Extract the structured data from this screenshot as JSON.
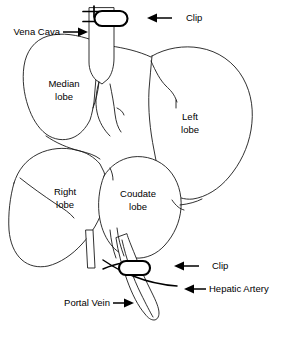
{
  "figure": {
    "background_color": "#ffffff",
    "line_color": "#1a1a1a",
    "text_color": "#000000"
  },
  "labels": {
    "vena_cava": "Vena Cava",
    "clip_top": "Clip",
    "median_lobe_line1": "Median",
    "median_lobe_line2": "lobe",
    "left_lobe_line1": "Left",
    "left_lobe_line2": "lobe",
    "right_lobe_line1": "Right",
    "right_lobe_line2": "lobe",
    "coudate_lobe_line1": "Coudate",
    "coudate_lobe_line2": "lobe",
    "clip_bottom": "Clip",
    "hepatic_artery": "Hepatic Artery",
    "portal_vein": "Portal Vein"
  },
  "annotations": [
    {
      "name": "vena-cava",
      "text": "Vena Cava",
      "arrow_direction": "right"
    },
    {
      "name": "clip-top",
      "text": "Clip",
      "arrow_direction": "left"
    },
    {
      "name": "clip-bottom",
      "text": "Clip",
      "arrow_direction": "left"
    },
    {
      "name": "hepatic-artery",
      "text": "Hepatic Artery",
      "arrow_direction": "left"
    },
    {
      "name": "portal-vein",
      "text": "Portal Vein",
      "arrow_direction": "right"
    }
  ],
  "structures": [
    {
      "name": "median-lobe",
      "label": "Median lobe"
    },
    {
      "name": "left-lobe",
      "label": "Left lobe"
    },
    {
      "name": "right-lobe",
      "label": "Right lobe"
    },
    {
      "name": "coudate-lobe",
      "label": "Coudate lobe"
    },
    {
      "name": "vena-cava-vessel",
      "label": "Vena Cava"
    },
    {
      "name": "portal-vein-vessel",
      "label": "Portal Vein"
    },
    {
      "name": "hepatic-artery-vessel",
      "label": "Hepatic Artery"
    },
    {
      "name": "clip-upper",
      "label": "Clip"
    },
    {
      "name": "clip-lower",
      "label": "Clip"
    }
  ]
}
